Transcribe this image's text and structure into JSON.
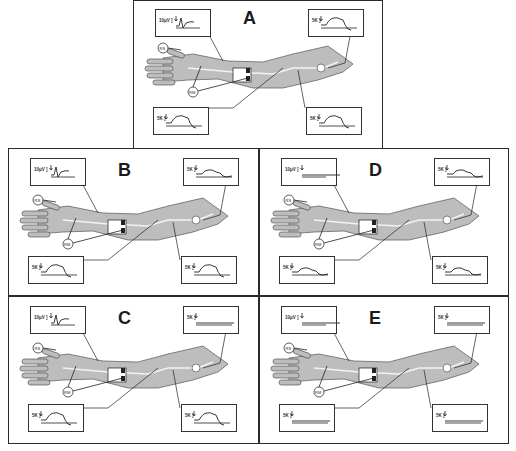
{
  "figure": {
    "panels": [
      {
        "id": "A",
        "label": "A",
        "traces": {
          "sensory_top": "10μV",
          "other": "5K"
        },
        "responses": {
          "digital_snap": "normal",
          "prox_above": "normal",
          "forearm_low": "normal",
          "upper_arm_low": "normal"
        }
      },
      {
        "id": "B",
        "label": "B",
        "traces": {
          "sensory_top": "10μV",
          "other": "5K"
        },
        "responses": {
          "digital_snap": "normal",
          "prox_above": "reduced",
          "forearm_low": "normal",
          "upper_arm_low": "normal"
        }
      },
      {
        "id": "C",
        "label": "C",
        "traces": {
          "sensory_top": "10μV",
          "other": "5K"
        },
        "responses": {
          "digital_snap": "normal",
          "prox_above": "absent",
          "forearm_low": "normal",
          "upper_arm_low": "normal"
        }
      },
      {
        "id": "D",
        "label": "D",
        "traces": {
          "sensory_top": "10μV",
          "other": "5K"
        },
        "responses": {
          "digital_snap": "absent",
          "prox_above": "reduced",
          "forearm_low": "reduced",
          "upper_arm_low": "reduced"
        }
      },
      {
        "id": "E",
        "label": "E",
        "traces": {
          "sensory_top": "10μV",
          "other": "5K"
        },
        "responses": {
          "digital_snap": "absent",
          "prox_above": "absent",
          "forearm_low": "absent",
          "upper_arm_low": "absent"
        }
      }
    ],
    "electrode_labels": {
      "stim": "RS",
      "record": "RM"
    },
    "colors": {
      "skin": "#bdbdbd",
      "line": "#2a2a2a",
      "nerve": "#f2f2f2"
    }
  }
}
